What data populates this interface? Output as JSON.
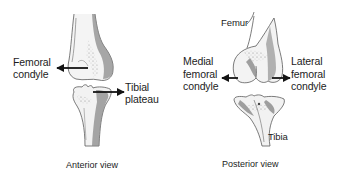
{
  "diagram": {
    "colors": {
      "background": "#ffffff",
      "text": "#1c1c1c",
      "bone_outline": "#4a4a4a",
      "bone_shade": "#8a8a8a",
      "arrow": "#141414"
    },
    "panels": [
      {
        "id": "anterior",
        "caption": "Anterior view",
        "labels": [
          {
            "id": "femoral-condyle",
            "lines": [
              "Femoral",
              "condyle"
            ],
            "arrow": "left"
          },
          {
            "id": "tibial-plateau",
            "lines": [
              "Tibial",
              "plateau"
            ],
            "arrow": "right"
          }
        ],
        "bones": [
          "femur",
          "tibia"
        ]
      },
      {
        "id": "posterior",
        "caption": "Posterior view",
        "labels": [
          {
            "id": "femur",
            "lines": [
              "Femur"
            ],
            "arrow": "none"
          },
          {
            "id": "medial-femoral-condyle",
            "lines": [
              "Medial",
              "femoral",
              "condyle"
            ],
            "arrow": "left"
          },
          {
            "id": "lateral-femoral-condyle",
            "lines": [
              "Lateral",
              "femoral",
              "condyle"
            ],
            "arrow": "right"
          },
          {
            "id": "tibia",
            "lines": [
              "Tibia"
            ],
            "arrow": "none"
          }
        ],
        "bones": [
          "femur",
          "tibia"
        ]
      }
    ]
  }
}
